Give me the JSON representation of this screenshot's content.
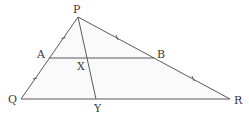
{
  "diagram": {
    "type": "geometry-triangle",
    "colors": {
      "stroke": "#5a5a5a",
      "fill": "#fafafa",
      "label": "#3a3a3a"
    },
    "points": {
      "P": {
        "label": "P",
        "x": 78,
        "y": 17
      },
      "Q": {
        "label": "Q",
        "x": 21,
        "y": 99
      },
      "R": {
        "label": "R",
        "x": 230,
        "y": 99
      },
      "A": {
        "label": "A",
        "x": 49,
        "y": 58
      },
      "B": {
        "label": "B",
        "x": 154,
        "y": 58
      },
      "X": {
        "label": "X",
        "x": 88,
        "y": 58
      },
      "Y": {
        "label": "Y",
        "x": 96,
        "y": 99
      }
    },
    "segments": [
      {
        "from": "P",
        "to": "Q"
      },
      {
        "from": "P",
        "to": "R"
      },
      {
        "from": "Q",
        "to": "R"
      },
      {
        "from": "A",
        "to": "B"
      },
      {
        "from": "P",
        "to": "Y"
      }
    ],
    "tick_marks": [
      {
        "segment": "PA",
        "count": 1
      },
      {
        "segment": "AQ",
        "count": 1
      },
      {
        "segment": "PB",
        "count": 1
      },
      {
        "segment": "BR",
        "count": 1
      }
    ]
  }
}
